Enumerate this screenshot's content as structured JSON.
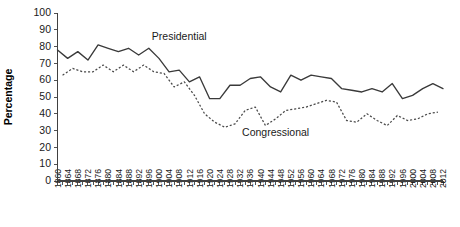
{
  "chart_data": {
    "type": "line",
    "title": "",
    "xlabel": "",
    "ylabel": "Percentage",
    "ylim": [
      0,
      100
    ],
    "ytick_step": 10,
    "xlim": [
      1860,
      2012
    ],
    "grid": false,
    "legend_position": "inline-annotations",
    "yticks": [
      "0",
      "10",
      "20",
      "30",
      "40",
      "50",
      "60",
      "70",
      "80",
      "90",
      "100"
    ],
    "categories": [
      "1860",
      "1864",
      "1868",
      "1872",
      "1876",
      "1880",
      "1884",
      "1888",
      "1892",
      "1896",
      "1900",
      "1904",
      "1908",
      "1912",
      "1916",
      "1920",
      "1924",
      "1928",
      "1932",
      "1936",
      "1940",
      "1944",
      "1948",
      "1952",
      "1956",
      "1960",
      "1964",
      "1968",
      "1972",
      "1976",
      "1980",
      "1984",
      "1988",
      "1992",
      "1996",
      "2000",
      "2004",
      "2008",
      "2012"
    ],
    "x_all": [
      1860,
      1862,
      1864,
      1866,
      1868,
      1870,
      1872,
      1874,
      1876,
      1878,
      1880,
      1882,
      1884,
      1886,
      1888,
      1890,
      1892,
      1894,
      1896,
      1898,
      1900,
      1902,
      1904,
      1906,
      1908,
      1910,
      1912,
      1914,
      1916,
      1918,
      1920,
      1922,
      1924,
      1926,
      1928,
      1930,
      1932,
      1934,
      1936,
      1938,
      1940,
      1942,
      1944,
      1946,
      1948,
      1950,
      1952,
      1954,
      1956,
      1958,
      1960,
      1962,
      1964,
      1966,
      1968,
      1970,
      1972,
      1974,
      1976,
      1978,
      1980,
      1982,
      1984,
      1986,
      1988,
      1990,
      1992,
      1994,
      1996,
      1998,
      2000,
      2002,
      2004,
      2006,
      2008,
      2010,
      2012
    ],
    "series": [
      {
        "name": "Presidential",
        "style": "solid",
        "annotation_label": "Presidential",
        "x": [
          1860,
          1864,
          1868,
          1872,
          1876,
          1880,
          1884,
          1888,
          1892,
          1896,
          1900,
          1904,
          1908,
          1912,
          1916,
          1920,
          1924,
          1928,
          1932,
          1936,
          1940,
          1944,
          1948,
          1952,
          1956,
          1960,
          1964,
          1968,
          1972,
          1976,
          1980,
          1984,
          1988,
          1992,
          1996,
          2000,
          2004,
          2008,
          2012
        ],
        "values": [
          78,
          73,
          77,
          72,
          81,
          79,
          77,
          79,
          75,
          79,
          73,
          65,
          66,
          59,
          62,
          49,
          49,
          57,
          57,
          61,
          62,
          56,
          53,
          63,
          60,
          63,
          62,
          61,
          55,
          54,
          53,
          55,
          53,
          58,
          49,
          51,
          55,
          58,
          55
        ]
      },
      {
        "name": "Congressional",
        "style": "dashed",
        "annotation_label": "Congressional",
        "x": [
          1862,
          1866,
          1870,
          1874,
          1878,
          1882,
          1886,
          1890,
          1894,
          1898,
          1902,
          1906,
          1910,
          1914,
          1918,
          1922,
          1926,
          1930,
          1934,
          1938,
          1942,
          1946,
          1950,
          1954,
          1958,
          1962,
          1966,
          1970,
          1974,
          1978,
          1982,
          1986,
          1990,
          1994,
          1998,
          2002,
          2006,
          2010
        ],
        "values": [
          63,
          67,
          65,
          65,
          69,
          65,
          69,
          65,
          69,
          65,
          64,
          56,
          59,
          51,
          40,
          35,
          32,
          34,
          42,
          44,
          33,
          37,
          42,
          43,
          44,
          46,
          48,
          47,
          36,
          35,
          40,
          36,
          33,
          39,
          36,
          37,
          40,
          41
        ]
      }
    ],
    "annotations": [
      {
        "text": "Presidential",
        "x": 1908,
        "y": 84
      },
      {
        "text": "Congressional",
        "x": 1946,
        "y": 27
      }
    ]
  }
}
